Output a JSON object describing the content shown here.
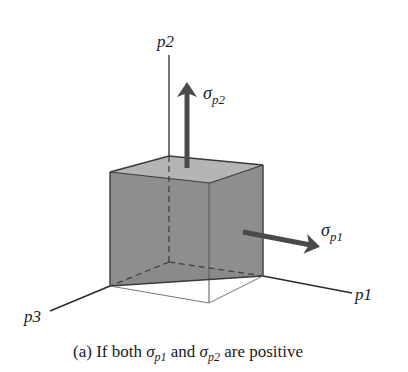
{
  "figure": {
    "axes": {
      "p1": "p1",
      "p2": "p2",
      "p3": "p3"
    },
    "stresses": {
      "sigma_p1": {
        "symbol": "σ",
        "subscript": "p1",
        "direction": "p1-positive"
      },
      "sigma_p2": {
        "symbol": "σ",
        "subscript": "p2",
        "direction": "p2-positive"
      }
    },
    "caption": {
      "label": "(a)",
      "text_1": " If both ",
      "sym1": "σ",
      "sub1": "p1",
      "text_2": " and ",
      "sym2": "σ",
      "sub2": "p2",
      "text_3": " are positive"
    },
    "colors": {
      "cube_fill": "#8a8a8a",
      "top_face": "#b8b8b8",
      "arrow": "#4a4a4a",
      "line": "#2a2a2a"
    }
  }
}
